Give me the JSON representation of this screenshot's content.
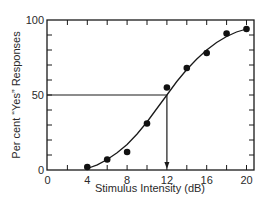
{
  "chart_data": {
    "type": "scatter",
    "title": "",
    "xlabel": "Stimulus Intensity (dB)",
    "ylabel": "Per cent “Yes” Responses",
    "xlim": [
      0,
      20.7
    ],
    "ylim": [
      0,
      100
    ],
    "x_ticks": [
      0,
      2,
      4,
      6,
      8,
      10,
      12,
      14,
      16,
      18,
      20
    ],
    "x_tick_labels": [
      "0",
      "4",
      "8",
      "12",
      "16",
      "20"
    ],
    "x_tick_label_values": [
      0,
      4,
      8,
      12,
      16,
      20
    ],
    "y_ticks": [
      0,
      10,
      20,
      30,
      40,
      50,
      60,
      70,
      80,
      90,
      100
    ],
    "y_tick_labels": [
      "0",
      "50",
      "100"
    ],
    "y_tick_label_values": [
      0,
      50,
      100
    ],
    "grid": false,
    "legend": null,
    "series": [
      {
        "name": "Observed responses",
        "style": "filled-circle",
        "x": [
          4,
          6,
          8,
          10,
          12,
          14,
          16,
          18,
          20
        ],
        "y": [
          2,
          7,
          12,
          31,
          55,
          68,
          78,
          91,
          94
        ]
      },
      {
        "name": "Fitted psychometric curve",
        "style": "line",
        "x": [
          4,
          5,
          6,
          7,
          8,
          9,
          10,
          11,
          12,
          13,
          14,
          15,
          16,
          17,
          18,
          19,
          20
        ],
        "y": [
          1,
          3.5,
          7,
          11.5,
          17,
          24,
          32,
          41,
          50,
          59,
          67,
          74,
          80,
          85,
          89,
          92,
          94
        ]
      }
    ],
    "annotations": [
      {
        "type": "threshold-line",
        "description": "Horizontal line from y-axis at 50% to curve, then vertical arrow down to x-axis",
        "y": 50,
        "x": 12
      }
    ]
  }
}
